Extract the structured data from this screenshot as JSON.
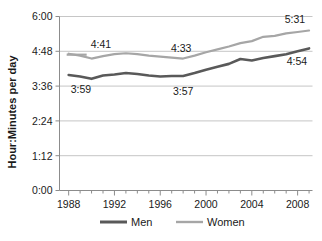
{
  "chart_data": {
    "type": "line",
    "title": "",
    "xlabel": "",
    "ylabel": "Hour:Minutes per day",
    "grid": true,
    "legend_position": "bottom",
    "xlim": [
      1987.2,
      2009.3
    ],
    "ylim": [
      0,
      360
    ],
    "y_tick_labels": [
      "0:00",
      "1:12",
      "2:24",
      "3:36",
      "4:48",
      "6:00"
    ],
    "y_tick_values": [
      0,
      72,
      144,
      216,
      288,
      360
    ],
    "x_tick_labels": [
      "1988",
      "1992",
      "1996",
      "2000",
      "2004",
      "2008"
    ],
    "x_tick_values": [
      1988,
      1992,
      1996,
      2000,
      2004,
      2008
    ],
    "x_minor_step": 1,
    "x": [
      1988,
      1989,
      1990,
      1991,
      1992,
      1993,
      1994,
      1995,
      1996,
      1997,
      1998,
      1999,
      2000,
      2001,
      2002,
      2003,
      2004,
      2005,
      2006,
      2007,
      2008,
      2009
    ],
    "series": [
      {
        "name": "Men",
        "color": "#595959",
        "width": 2.6,
        "values": [
          239,
          236,
          231,
          238,
          240,
          243,
          241,
          238,
          236,
          237,
          237,
          243,
          250,
          256,
          262,
          272,
          269,
          274,
          278,
          282,
          288,
          294
        ]
      },
      {
        "name": "Women",
        "color": "#a6a6a6",
        "width": 2.2,
        "values": [
          283,
          279,
          273,
          278,
          282,
          284,
          282,
          279,
          277,
          275,
          273,
          279,
          286,
          292,
          298,
          305,
          309,
          318,
          320,
          325,
          328,
          331
        ]
      }
    ],
    "annotations": [
      {
        "id": "women-start",
        "text": "4:41",
        "series": "Women",
        "x": 1988,
        "value": 281
      },
      {
        "id": "men-start",
        "text": "3:59",
        "series": "Men",
        "x": 1988,
        "value": 239
      },
      {
        "id": "women-mid",
        "text": "4:33",
        "series": "Women",
        "x": 1998,
        "value": 273
      },
      {
        "id": "men-mid",
        "text": "3:57",
        "series": "Men",
        "x": 1998,
        "value": 237
      },
      {
        "id": "women-end",
        "text": "5:31",
        "series": "Women",
        "x": 2009,
        "value": 331
      },
      {
        "id": "men-end",
        "text": "4:54",
        "series": "Men",
        "x": 2009,
        "value": 294
      }
    ],
    "legend": [
      {
        "label": "Men",
        "color": "#595959"
      },
      {
        "label": "Women",
        "color": "#a6a6a6"
      }
    ]
  },
  "style": {
    "axis_color": "#8c8c8c",
    "grid_color": "#bfbfbf",
    "text_color": "#1a1a1a",
    "background": "#ffffff"
  }
}
